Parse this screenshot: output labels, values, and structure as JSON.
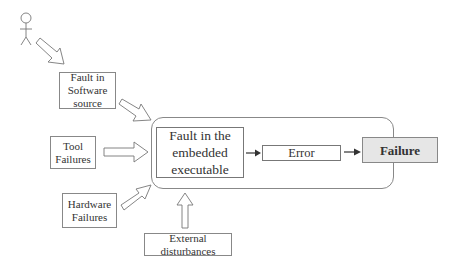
{
  "diagram": {
    "actor": {
      "icon": "stick-figure-icon"
    },
    "sources": [
      {
        "id": "software",
        "label": "Fault in Software source"
      },
      {
        "id": "tool",
        "label": "Tool Failures"
      },
      {
        "id": "hardware",
        "label": "Hardware Failures"
      },
      {
        "id": "external",
        "label": "External disturbances"
      }
    ],
    "chain": {
      "fault": "Fault in the embedded executable",
      "error": "Error",
      "failure": "Failure"
    },
    "colors": {
      "stroke": "#888888",
      "failure_fill": "#e6e6e6",
      "text": "#333333"
    }
  }
}
